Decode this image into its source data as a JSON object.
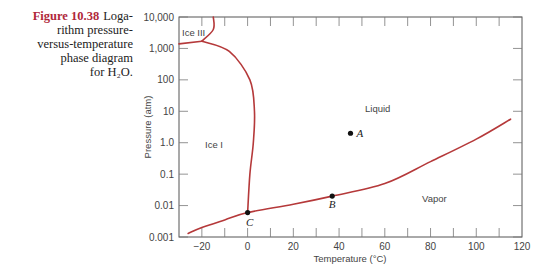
{
  "caption": {
    "figure_label": "Figure 10.38",
    "lines": [
      "Loga-",
      "rithm pressure-",
      "versus-temperature",
      "phase diagram",
      "for H₂O."
    ]
  },
  "chart_data": {
    "type": "line",
    "xlabel": "Temperature (°C)",
    "ylabel": "Pressure (atm)",
    "xlim": [
      -30,
      120
    ],
    "ylim": [
      0.001,
      10000
    ],
    "yscale": "log",
    "x_ticks": [
      -20,
      0,
      20,
      40,
      60,
      80,
      100,
      120
    ],
    "x_tick_labels": [
      "−20",
      "0",
      "20",
      "40",
      "60",
      "80",
      "100",
      "120"
    ],
    "x_minor_ticks": [
      -20,
      -10,
      0,
      10,
      20,
      30,
      40,
      50,
      60,
      70,
      80,
      90,
      100,
      110
    ],
    "y_ticks": [
      0.001,
      0.01,
      0.1,
      1.0,
      10,
      100,
      1000,
      10000
    ],
    "y_tick_labels": [
      "0.001",
      "0.01",
      "0.1",
      "1.0",
      "10",
      "100",
      "1,000",
      "10,000"
    ],
    "grid": false,
    "line_color": "#b5393a",
    "series": [
      {
        "name": "Vapor pressure curve (liquid-vapor / solid-vapor)",
        "points": [
          [
            -26,
            0.0013
          ],
          [
            -20,
            0.002
          ],
          [
            -10,
            0.0035
          ],
          [
            0.01,
            0.006
          ],
          [
            20,
            0.011
          ],
          [
            37,
            0.02
          ],
          [
            60,
            0.05
          ],
          [
            80,
            0.25
          ],
          [
            100,
            1.3
          ],
          [
            115,
            5.6
          ]
        ]
      },
      {
        "name": "Ice I - Liquid boundary",
        "points": [
          [
            0.01,
            0.006
          ],
          [
            1,
            0.1
          ],
          [
            2.5,
            1.0
          ],
          [
            3,
            10
          ],
          [
            1,
            100
          ],
          [
            -8,
            800
          ],
          [
            -20,
            1700
          ]
        ]
      },
      {
        "name": "Ice I - Ice III boundary",
        "points": [
          [
            -30,
            1400
          ],
          [
            -20,
            1700
          ]
        ]
      },
      {
        "name": "Ice III - Liquid boundary",
        "points": [
          [
            -20,
            1700
          ],
          [
            -15,
            4000
          ],
          [
            -15,
            10000
          ]
        ]
      }
    ],
    "annotations": [
      {
        "label": "A",
        "x": 45,
        "y": 2.0,
        "marker": true
      },
      {
        "label": "B",
        "x": 37,
        "y": 0.02,
        "marker": true
      },
      {
        "label": "C",
        "x": 0.01,
        "y": 0.006,
        "marker": true
      }
    ],
    "region_labels": [
      "Ice III",
      "Ice I",
      "Liquid",
      "Vapor"
    ]
  }
}
